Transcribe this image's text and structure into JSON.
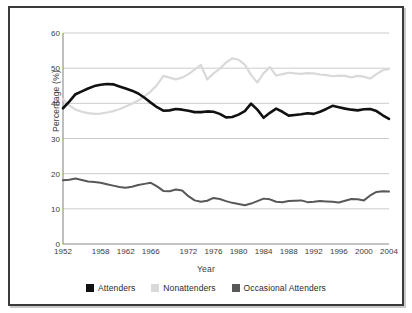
{
  "figure": {
    "border_color": "#3a3a3a",
    "background": "#ffffff"
  },
  "chart_data": {
    "type": "line",
    "title": "",
    "xlabel": "Year",
    "ylabel": "Percentage (%)",
    "xlim": [
      1952,
      2004
    ],
    "ylim": [
      0,
      60
    ],
    "yticks": [
      0,
      10,
      20,
      30,
      40,
      50,
      60
    ],
    "xticks": [
      1952,
      1958,
      1962,
      1966,
      1972,
      1976,
      1980,
      1984,
      1988,
      1992,
      1996,
      2000,
      2004
    ],
    "grid": "horizontal",
    "legend_position": "bottom",
    "x": [
      1952,
      1953,
      1954,
      1955,
      1956,
      1957,
      1958,
      1959,
      1960,
      1961,
      1962,
      1963,
      1964,
      1965,
      1966,
      1967,
      1968,
      1969,
      1970,
      1971,
      1972,
      1973,
      1974,
      1975,
      1976,
      1977,
      1978,
      1979,
      1980,
      1981,
      1982,
      1983,
      1984,
      1985,
      1986,
      1987,
      1988,
      1989,
      1990,
      1991,
      1992,
      1993,
      1994,
      1995,
      1996,
      1997,
      1998,
      1999,
      2000,
      2001,
      2002,
      2003,
      2004
    ],
    "series": [
      {
        "name": "Attenders",
        "color": "#111111",
        "width": 2.6,
        "values": [
          38.6,
          40.5,
          42.6,
          43.4,
          44.2,
          44.9,
          45.3,
          45.5,
          45.4,
          44.8,
          44.2,
          43.6,
          42.8,
          41.6,
          40.2,
          38.9,
          37.9,
          38.0,
          38.4,
          38.2,
          37.9,
          37.5,
          37.5,
          37.7,
          37.6,
          37.0,
          36.0,
          36.1,
          36.8,
          37.8,
          39.9,
          38.2,
          35.9,
          37.3,
          38.5,
          37.6,
          36.5,
          36.7,
          36.9,
          37.2,
          37.0,
          37.6,
          38.4,
          39.3,
          38.9,
          38.5,
          38.2,
          38.0,
          38.3,
          38.4,
          37.8,
          36.6,
          35.6
        ]
      },
      {
        "name": "Nonattenders",
        "color": "#d9d9d9",
        "width": 2.2,
        "values": [
          41.2,
          39.4,
          38.2,
          37.6,
          37.2,
          37.0,
          37.1,
          37.4,
          37.8,
          38.3,
          39.1,
          39.9,
          40.8,
          42.0,
          43.4,
          45.2,
          47.8,
          47.3,
          46.8,
          47.3,
          48.3,
          49.6,
          50.9,
          46.8,
          48.5,
          49.8,
          51.6,
          52.8,
          52.4,
          51.0,
          48.1,
          45.9,
          48.6,
          50.3,
          47.9,
          48.3,
          48.7,
          48.5,
          48.4,
          48.6,
          48.5,
          48.2,
          48.0,
          47.7,
          47.9,
          47.8,
          47.4,
          47.8,
          47.6,
          47.0,
          48.3,
          49.4,
          49.8
        ]
      },
      {
        "name": "Occasional Attenders",
        "color": "#585858",
        "width": 2.0,
        "values": [
          18.1,
          18.3,
          18.6,
          18.2,
          17.8,
          17.6,
          17.4,
          17.0,
          16.6,
          16.2,
          16.0,
          16.3,
          16.8,
          17.1,
          17.4,
          16.4,
          15.1,
          15.0,
          15.5,
          15.2,
          13.6,
          12.4,
          12.0,
          12.3,
          13.1,
          12.8,
          12.2,
          11.7,
          11.4,
          11.0,
          11.5,
          12.2,
          12.9,
          12.7,
          12.0,
          11.9,
          12.2,
          12.3,
          12.4,
          11.9,
          12.0,
          12.2,
          12.1,
          12.0,
          11.8,
          12.3,
          12.8,
          12.7,
          12.4,
          13.8,
          14.8,
          15.0,
          14.9
        ]
      }
    ]
  },
  "legend": {
    "items": [
      {
        "label": "Attenders",
        "color": "#111111"
      },
      {
        "label": "Nonattenders",
        "color": "#d9d9d9"
      },
      {
        "label": "Occasional Attenders",
        "color": "#585858"
      }
    ]
  }
}
